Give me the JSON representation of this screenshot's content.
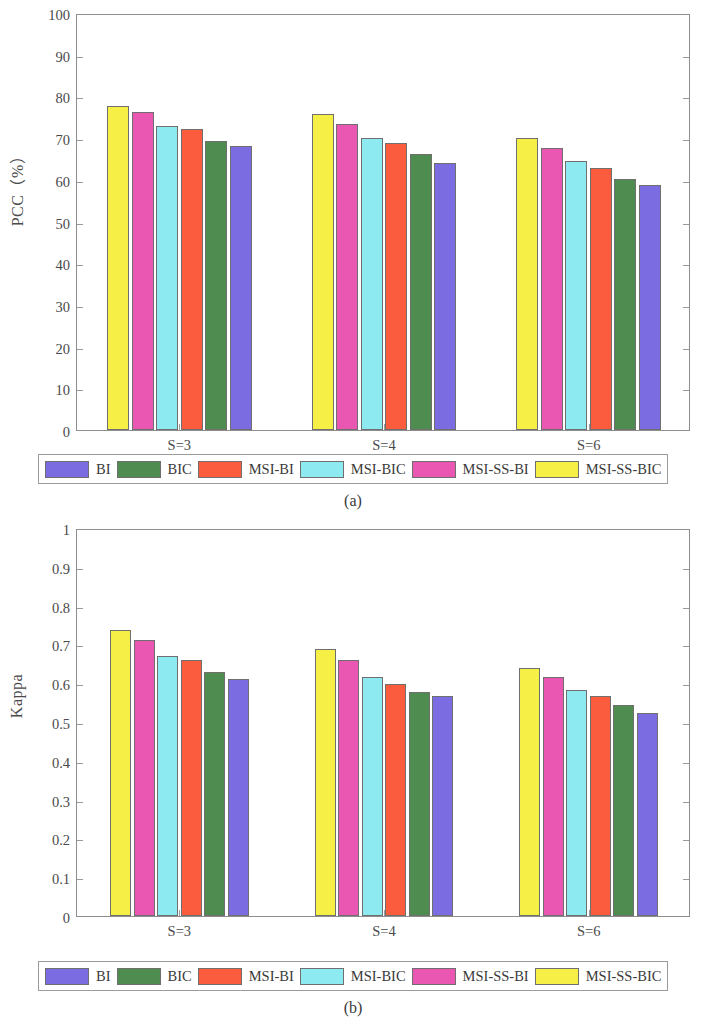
{
  "figure": {
    "panels": [
      {
        "caption": "(a)",
        "ylabel": "PCC（%）",
        "xlabel": ""
      },
      {
        "caption": "(b)",
        "ylabel": "Kappa",
        "xlabel": ""
      }
    ],
    "legend_labels": [
      "BI",
      "BIC",
      "MSI-BI",
      "MSI-BIC",
      "MSI-SS-BI",
      "MSI-SS-BIC"
    ],
    "legend_colors": [
      "#7b6ce2",
      "#4f8c4f",
      "#fb5c3d",
      "#8ceaf0",
      "#ea57b2",
      "#f6ef46"
    ]
  },
  "colors": {
    "BI": "#7b6ce2",
    "BIC": "#4f8c4f",
    "MSI-BI": "#fb5c3d",
    "MSI-BIC": "#8ceaf0",
    "MSI-SS-BI": "#ea57b2",
    "MSI-SS-BIC": "#f6ef46",
    "axis": "#8d8d8d",
    "bar_edge": "#6f6f6f",
    "text": "#3a3a3a"
  },
  "chart_data": [
    {
      "type": "bar",
      "title": "(a)",
      "xlabel": "",
      "ylabel": "PCC（%）",
      "categories": [
        "S=3",
        "S=4",
        "S=6"
      ],
      "ylim": [
        0,
        100
      ],
      "yticks": [
        0,
        10,
        20,
        30,
        40,
        50,
        60,
        70,
        80,
        90,
        100
      ],
      "ytick_labels": [
        "0",
        "10",
        "20",
        "30",
        "40",
        "50",
        "60",
        "70",
        "80",
        "90",
        "100"
      ],
      "grid": false,
      "legend_position": "below-axes",
      "bar_order": [
        "MSI-SS-BIC",
        "MSI-SS-BI",
        "MSI-BIC",
        "MSI-BI",
        "BIC",
        "BI"
      ],
      "series": [
        {
          "name": "MSI-SS-BIC",
          "color": "#f6ef46",
          "values": [
            77.8,
            75.8,
            70.0
          ]
        },
        {
          "name": "MSI-SS-BI",
          "color": "#ea57b2",
          "values": [
            76.2,
            73.3,
            67.7
          ]
        },
        {
          "name": "MSI-BIC",
          "color": "#8ceaf0",
          "values": [
            73.0,
            70.0,
            64.6
          ]
        },
        {
          "name": "MSI-BI",
          "color": "#fb5c3d",
          "values": [
            72.2,
            68.8,
            62.8
          ]
        },
        {
          "name": "BIC",
          "color": "#4f8c4f",
          "values": [
            69.3,
            66.2,
            60.3
          ]
        },
        {
          "name": "BI",
          "color": "#7b6ce2",
          "values": [
            68.0,
            64.0,
            58.8
          ]
        }
      ]
    },
    {
      "type": "bar",
      "title": "(b)",
      "xlabel": "",
      "ylabel": "Kappa",
      "categories": [
        "S=3",
        "S=4",
        "S=6"
      ],
      "ylim": [
        0,
        1
      ],
      "yticks": [
        0,
        0.1,
        0.2,
        0.3,
        0.4,
        0.5,
        0.6,
        0.7,
        0.8,
        0.9,
        1
      ],
      "ytick_labels": [
        "0",
        "0.1",
        "0.2",
        "0.3",
        "0.4",
        "0.5",
        "0.6",
        "0.7",
        "0.8",
        "0.9",
        "1"
      ],
      "grid": false,
      "legend_position": "below-axes",
      "bar_order": [
        "MSI-SS-BIC",
        "MSI-SS-BI",
        "MSI-BIC",
        "MSI-BI",
        "BIC",
        "BI"
      ],
      "series": [
        {
          "name": "MSI-SS-BIC",
          "color": "#f6ef46",
          "values": [
            0.738,
            0.687,
            0.639
          ]
        },
        {
          "name": "MSI-SS-BI",
          "color": "#ea57b2",
          "values": [
            0.712,
            0.659,
            0.617
          ]
        },
        {
          "name": "MSI-BIC",
          "color": "#8ceaf0",
          "values": [
            0.671,
            0.617,
            0.583
          ]
        },
        {
          "name": "MSI-BI",
          "color": "#fb5c3d",
          "values": [
            0.661,
            0.599,
            0.566
          ]
        },
        {
          "name": "BIC",
          "color": "#4f8c4f",
          "values": [
            0.63,
            0.577,
            0.543
          ]
        },
        {
          "name": "BI",
          "color": "#7b6ce2",
          "values": [
            0.61,
            0.566,
            0.522
          ]
        }
      ]
    }
  ]
}
